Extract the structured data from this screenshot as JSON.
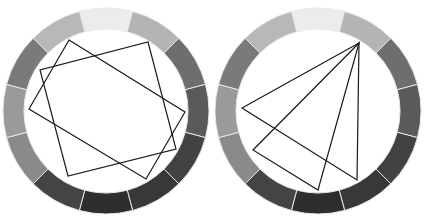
{
  "diagram": {
    "segment_count": 12,
    "wheels": [
      {
        "id": "left",
        "segments_clockwise_from_top": [
          "#ececec",
          "#b4b4b4",
          "#6e6e6e",
          "#5a5a5a",
          "#424242",
          "#383838",
          "#2e2e2e",
          "#444444",
          "#8a8a8a",
          "#9a9a9a",
          "#7a7a7a",
          "#b8b8b8"
        ],
        "shapes": [
          {
            "name": "square-a",
            "vertex_segments": [
              10.5,
              2.6,
              4.6,
              8.6
            ]
          },
          {
            "name": "square-b",
            "vertex_segments": [
              0.9,
              3.9,
              6.8,
              9.9
            ]
          }
        ]
      },
      {
        "id": "right",
        "segments_clockwise_from_top": [
          "#ececec",
          "#b4b4b4",
          "#6e6e6e",
          "#5a5a5a",
          "#424242",
          "#383838",
          "#2e2e2e",
          "#444444",
          "#8a8a8a",
          "#9a9a9a",
          "#7a7a7a",
          "#b8b8b8"
        ],
        "shapes": [
          {
            "name": "triangle-a",
            "vertex_segments": [
              1,
              9,
              5
            ]
          },
          {
            "name": "triangle-b",
            "vertex_segments": [
              1,
              8,
              6
            ]
          }
        ]
      }
    ],
    "line_color": "#1a1a1a",
    "separator_color": "#e8e8e8"
  }
}
